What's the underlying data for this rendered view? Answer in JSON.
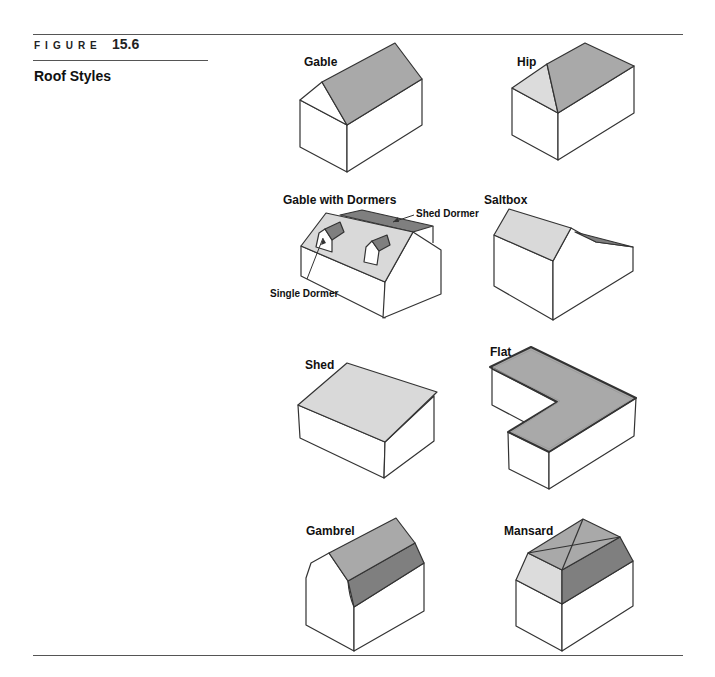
{
  "header": {
    "figure_label": "FIGURE",
    "figure_number": "15.6",
    "title": "Roof Styles"
  },
  "colors": {
    "line": "#333333",
    "roof_mid": "#a9a9a9",
    "roof_light": "#d9d9d9",
    "roof_dark": "#7f7f7f",
    "wall": "#ffffff",
    "rule": "#555555"
  },
  "roofs": [
    {
      "name": "Gable",
      "label_pos": [
        304,
        62
      ]
    },
    {
      "name": "Hip",
      "label_pos": [
        517,
        62
      ]
    },
    {
      "name": "Gable with Dormers",
      "label_pos": [
        283,
        201
      ]
    },
    {
      "name": "Saltbox",
      "label_pos": [
        484,
        201
      ]
    },
    {
      "name": "Shed",
      "label_pos": [
        305,
        369
      ]
    },
    {
      "name": "Flat",
      "label_pos": [
        490,
        355
      ]
    },
    {
      "name": "Gambrel",
      "label_pos": [
        306,
        532
      ]
    },
    {
      "name": "Mansard",
      "label_pos": [
        504,
        532
      ]
    }
  ],
  "callouts": {
    "shed_dormer": "Shed Dormer",
    "single_dormer": "Single Dormer"
  }
}
